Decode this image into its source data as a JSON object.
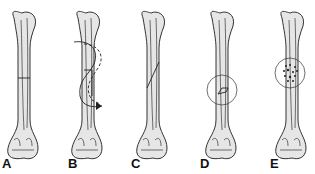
{
  "figure": {
    "panels": [
      {
        "label": "A",
        "fracture": "transverse",
        "x": 24
      },
      {
        "label": "B",
        "fracture": "spiral",
        "x": 88
      },
      {
        "label": "C",
        "fracture": "oblique",
        "x": 153
      },
      {
        "label": "D",
        "fracture": "pathologic (circled lesion)",
        "x": 222
      },
      {
        "label": "E",
        "fracture": "comminuted (circled)",
        "x": 292
      }
    ]
  },
  "colors": {
    "bone_fill": "#e6e6e6",
    "outline": "#333333",
    "background": "#ffffff"
  }
}
